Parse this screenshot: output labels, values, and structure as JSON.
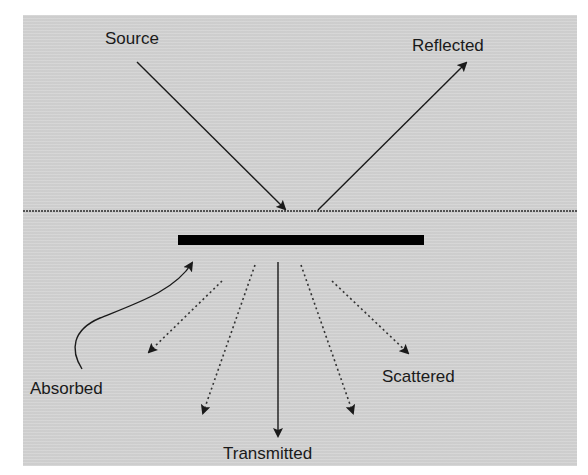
{
  "diagram": {
    "title": "",
    "background_color": "#d4d4d4",
    "ink_color": "#1a1a1a",
    "labels": {
      "source": "Source",
      "reflected": "Reflected",
      "absorbed": "Absorbed",
      "scattered": "Scattered",
      "transmitted": "Transmitted"
    },
    "elements": {
      "surface_line": {
        "style": "dotted",
        "y": 211
      },
      "slab": {
        "style": "solid-black-bar"
      },
      "incident_arrow": {
        "label": "Source",
        "style": "solid"
      },
      "reflected_arrow": {
        "label": "Reflected",
        "style": "solid"
      },
      "absorbed_arrow": {
        "label": "Absorbed",
        "style": "solid-curved"
      },
      "transmitted_arrow": {
        "label": "Transmitted",
        "style": "solid"
      },
      "scattered_arrows": {
        "label": "Scattered",
        "style": "dotted",
        "count": 4
      }
    }
  }
}
